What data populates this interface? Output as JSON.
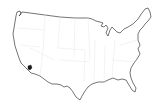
{
  "map": {
    "subject": "Contiguous United States outline",
    "style": "outline with faint state borders",
    "highlighted_region": {
      "name": "Southern California (Los Angeles area)",
      "color": "#1a1a1a"
    },
    "colors": {
      "background": "#ffffff",
      "outline": "#3a3a3a",
      "state_borders": "#e6e6e6"
    }
  }
}
